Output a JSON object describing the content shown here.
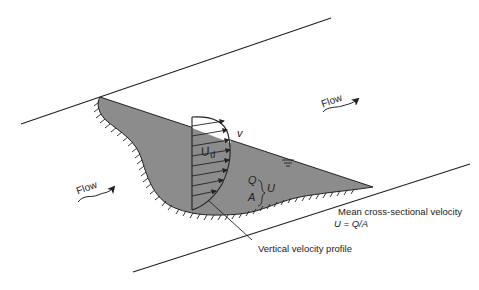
{
  "diagram": {
    "type": "open-channel cross-section with vertical velocity profile",
    "colors": {
      "water_fill": "#8c8c8c",
      "line": "#222222",
      "background": "#ffffff"
    },
    "labels": {
      "flow_left": "Flow",
      "flow_right": "Flow",
      "local_velocity": "v",
      "depth_avg_velocity": "U",
      "depth_avg_subscript": "d",
      "discharge": "Q",
      "area": "A",
      "mean_velocity_symbol": "U",
      "mean_velocity_title": "Mean cross-sectional velocity",
      "mean_velocity_formula": "U = Q/A",
      "profile_caption": "Vertical velocity profile"
    },
    "icons": [
      "flow-arrow-icon",
      "water-surface-icon",
      "bed-hatch-icon"
    ]
  }
}
